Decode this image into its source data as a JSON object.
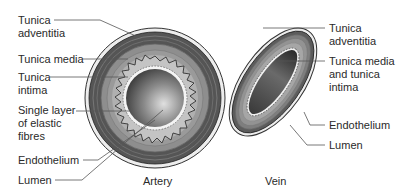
{
  "artery": {
    "title": "Artery",
    "labels": {
      "tunica_adventitia": "Tunica\nadventitia",
      "tunica_media": "Tunica media",
      "tunica_intima": "Tunica\nintima",
      "elastic_fibres": "Single layer\nof elastic\nfibres",
      "endothelium": "Endothelium",
      "lumen": "Lumen"
    }
  },
  "vein": {
    "title": "Vein",
    "labels": {
      "tunica_adventitia": "Tunica\nadventitia",
      "tunica_media_intima": "Tunica media\nand tunica\nintima",
      "endothelium": "Endothelium",
      "lumen": "Lumen"
    }
  },
  "colors": {
    "outer_ring": "#e8e8e8",
    "adventitia": "#5a5a5a",
    "media": "#8c8c8c",
    "lumen_dark": "#3a3a3a",
    "lumen_light": "#d8d8d8",
    "leader_line": "#555555"
  }
}
